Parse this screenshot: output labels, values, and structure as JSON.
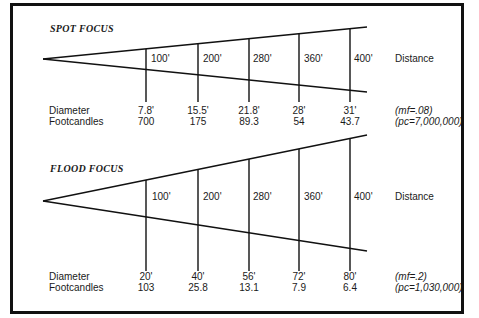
{
  "spot": {
    "title": "SPOT FOCUS",
    "distance_label": "Distance",
    "distances": [
      "100'",
      "200'",
      "280'",
      "360'",
      "400'"
    ],
    "row_labels": {
      "diameter": "Diameter",
      "footcandles": "Footcandles"
    },
    "diameters": [
      "7.8'",
      "15.5'",
      "21.8'",
      "28'",
      "31'"
    ],
    "footcandles": [
      "700",
      "175",
      "89.3",
      "54",
      "43.7"
    ],
    "mf": "(mf=.08)",
    "pc": "(pc=7,000,000)"
  },
  "flood": {
    "title": "FLOOD FOCUS",
    "distance_label": "Distance",
    "distances": [
      "100'",
      "200'",
      "280'",
      "360'",
      "400'"
    ],
    "row_labels": {
      "diameter": "Diameter",
      "footcandles": "Footcandles"
    },
    "diameters": [
      "20'",
      "40'",
      "56'",
      "72'",
      "80'"
    ],
    "footcandles": [
      "103",
      "25.8",
      "13.1",
      "7.9",
      "6.4"
    ],
    "mf": "(mf=.2)",
    "pc": "(pc=1,030,000)"
  }
}
